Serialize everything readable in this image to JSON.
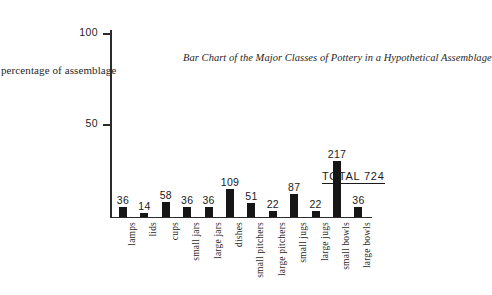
{
  "chart_data": {
    "type": "bar",
    "title": "Bar Chart of the Major Classes of Pottery in a Hypothetical Assemblage",
    "xlabel": "",
    "ylabel": "percentage of assemblage",
    "ylim": [
      0,
      110
    ],
    "yticks": [
      50,
      100
    ],
    "ytick_labels": [
      "50",
      "100"
    ],
    "grid": false,
    "legend": null,
    "total_label": "TOTAL  724",
    "total": 724,
    "value_unit": "count",
    "categories": [
      "lamps",
      "lids",
      "cups",
      "small jars",
      "large jars",
      "dishes",
      "small pitchers",
      "large pitchers",
      "small jugs",
      "large jugs",
      "small bowls",
      "large bowls"
    ],
    "values": [
      36,
      14,
      58,
      36,
      36,
      109,
      51,
      22,
      87,
      22,
      217,
      36
    ],
    "percentages": [
      4.97,
      1.93,
      8.01,
      4.97,
      4.97,
      15.06,
      7.04,
      3.04,
      12.02,
      3.04,
      29.97,
      4.97
    ],
    "value_labels": [
      "36",
      "14",
      "58",
      "36",
      "36",
      "109",
      "51",
      "22",
      "87",
      "22",
      "217",
      "36"
    ],
    "bar_color": "#161616",
    "axis_color": "#2b2b2b",
    "background_color": "#ffffff"
  }
}
